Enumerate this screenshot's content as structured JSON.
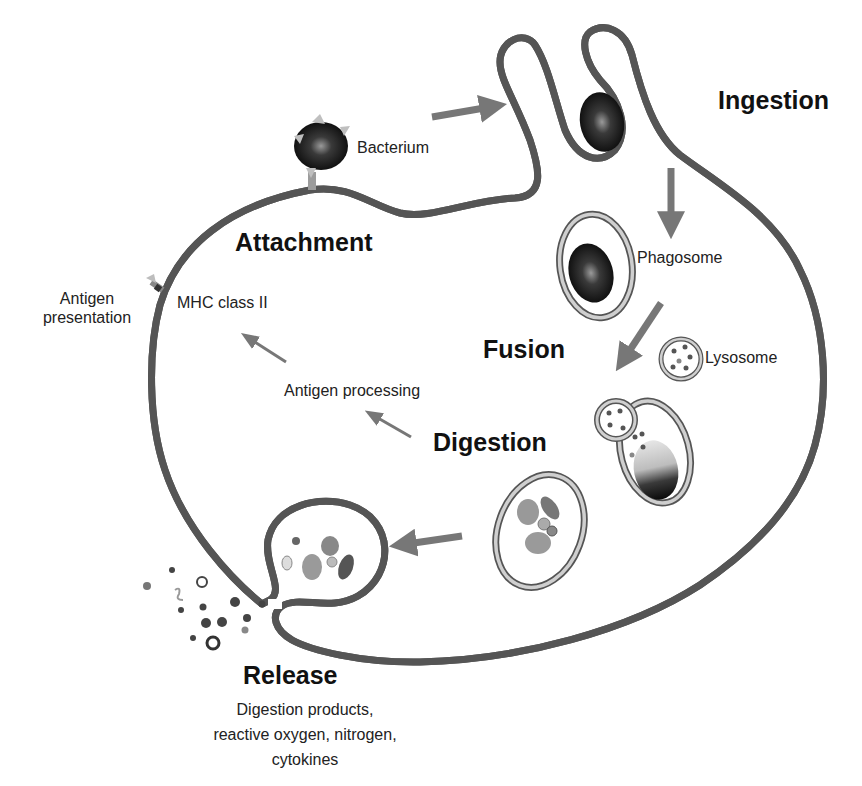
{
  "diagram": {
    "stages": {
      "attachment": "Attachment",
      "ingestion": "Ingestion",
      "fusion": "Fusion",
      "digestion": "Digestion",
      "release": "Release"
    },
    "labels": {
      "bacterium": "Bacterium",
      "phagosome": "Phagosome",
      "lysosome": "Lysosome",
      "mhc": "MHC class II",
      "antigen_presentation_line1": "Antigen",
      "antigen_presentation_line2": "presentation",
      "antigen_processing": "Antigen processing"
    },
    "release_description": {
      "line1": "Digestion products,",
      "line2": "reactive oxygen, nitrogen,",
      "line3": "cytokines"
    },
    "colors": {
      "membrane_outer": "#555555",
      "membrane_fill": "#c8c8c8",
      "arrow": "#777777",
      "bacterium": "#111111",
      "text": "#1a1a1a"
    }
  }
}
